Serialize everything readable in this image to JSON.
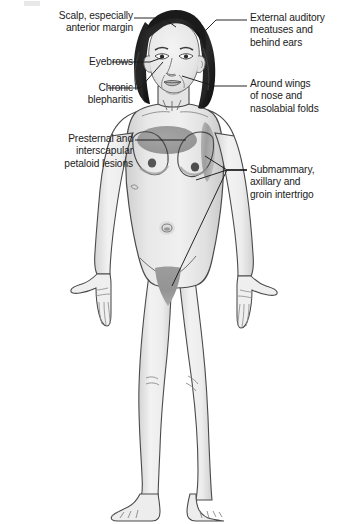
{
  "figure": {
    "width": 352,
    "height": 524
  },
  "labels": {
    "scalp": {
      "name": "scalp-label",
      "lines": [
        "Scalp, especially",
        "anterior margin"
      ],
      "line1": "Scalp, especially",
      "line2": "anterior margin",
      "side": "left",
      "target": "anterior hairline"
    },
    "eyebrows": {
      "name": "eyebrows-label",
      "lines": [
        "Eyebrows"
      ],
      "line1": "Eyebrows",
      "side": "left",
      "target": "eyebrow region"
    },
    "blepharitis": {
      "name": "chronic-blepharitis-label",
      "lines": [
        "Chronic",
        "blepharitis"
      ],
      "line1": "Chronic",
      "line2": "blepharitis",
      "side": "left",
      "target": "eyelid margins"
    },
    "presternal": {
      "name": "presternal-label",
      "lines": [
        "Presternal and",
        "interscapular",
        "petaloid lesions"
      ],
      "line1": "Presternal and",
      "line2": "interscapular",
      "line3": "petaloid lesions",
      "side": "left",
      "target": "presternal chest patch"
    },
    "auditory": {
      "name": "external-auditory-label",
      "lines": [
        "External auditory",
        "meatuses and",
        "behind ears"
      ],
      "line1": "External auditory",
      "line2": "meatuses and",
      "line3": "behind ears",
      "side": "right",
      "target": "ear and post-auricular region"
    },
    "nose": {
      "name": "nasolabial-label",
      "lines": [
        "Around wings",
        "of nose and",
        "nasolabial folds"
      ],
      "line1": "Around wings",
      "line2": "of nose and",
      "line3": "nasolabial folds",
      "side": "right",
      "target": "alae nasi and nasolabial folds"
    },
    "intertrigo": {
      "name": "intertrigo-label",
      "lines": [
        "Submammary,",
        "axillary and",
        "groin intertrigo"
      ],
      "line1": "Submammary,",
      "line2": "axillary and",
      "line3": "groin intertrigo",
      "side": "right",
      "targets": [
        "inframammary fold",
        "axilla",
        "groin"
      ]
    }
  },
  "colors": {
    "background": "#ffffff",
    "text": "#1a1a1a",
    "leader_line": "#1a1a1a",
    "outline": "#3c3c3c",
    "skin_light": "#ececec",
    "skin_mid": "#dcdcdc",
    "skin_shadow": "#c9c9c9",
    "lesion_gray": "#9a9a9a",
    "lesion_gray_dark": "#8e8e8e",
    "hair_dark": "#1c1c1c",
    "hair_mid": "#4a4a4a",
    "nipple": "#5a5a5a"
  },
  "affected_regions": [
    {
      "id": "scalp-margin",
      "name": "anterior scalp margin",
      "shown_as": "hairline"
    },
    {
      "id": "eyebrow",
      "name": "eyebrows",
      "shown_as": "brow marks"
    },
    {
      "id": "eyelid",
      "name": "eyelid margins / blepharitis",
      "shown_as": "lid marks"
    },
    {
      "id": "ear",
      "name": "external auditory meatus / behind ears",
      "shown_as": "ear shading"
    },
    {
      "id": "nasolabial",
      "name": "nasal alae and nasolabial folds",
      "shown_as": "fold lines"
    },
    {
      "id": "presternal",
      "name": "presternal petaloid patch",
      "shown_as": "gray ellipse"
    },
    {
      "id": "axilla",
      "name": "axillary intertrigo",
      "shown_as": "gray vertical patch"
    },
    {
      "id": "submammary",
      "name": "submammary intertrigo",
      "shown_as": "inframammary shading"
    },
    {
      "id": "groin",
      "name": "groin intertrigo",
      "shown_as": "gray triangular patch"
    }
  ]
}
